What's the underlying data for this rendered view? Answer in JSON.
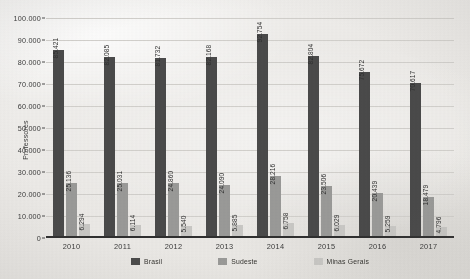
{
  "chart_data": {
    "type": "bar",
    "title": "",
    "xlabel": "",
    "ylabel": "Professores",
    "ylim": [
      0,
      100000
    ],
    "ytick_labels": [
      "100.000",
      "90.000",
      "80.000",
      "70.000",
      "60.000",
      "50.000",
      "40.000",
      "30.000",
      "20.000",
      "10.000",
      "0"
    ],
    "ytick_values": [
      100000,
      90000,
      80000,
      70000,
      60000,
      50000,
      40000,
      30000,
      20000,
      10000,
      0
    ],
    "grid": true,
    "legend_position": "bottom",
    "categories": [
      "2010",
      "2011",
      "2012",
      "2013",
      "2014",
      "2015",
      "2016",
      "2017"
    ],
    "series": [
      {
        "name": "Brasil",
        "color": "#4a4a4a",
        "values": [
          85421,
          82085,
          81732,
          82168,
          92754,
          82804,
          75672,
          70617
        ],
        "labels": [
          "85.421",
          "82.085",
          "81.732",
          "82.168",
          "92.754",
          "82.804",
          "75.672",
          "70.617"
        ]
      },
      {
        "name": "Sudeste",
        "color": "#9a9a98",
        "values": [
          25136,
          25031,
          24860,
          24090,
          28216,
          23506,
          20439,
          18479
        ],
        "labels": [
          "25.136",
          "25.031",
          "24.860",
          "24.090",
          "28.216",
          "23.506",
          "20.439",
          "18.479"
        ]
      },
      {
        "name": "Minas Gerais",
        "color": "#c9c8c5",
        "values": [
          6294,
          6114,
          5540,
          5885,
          6758,
          6029,
          5259,
          4796
        ],
        "labels": [
          "6.294",
          "6.114",
          "5.540",
          "5.885",
          "6.758",
          "6.029",
          "5.259",
          "4.796"
        ]
      }
    ]
  }
}
